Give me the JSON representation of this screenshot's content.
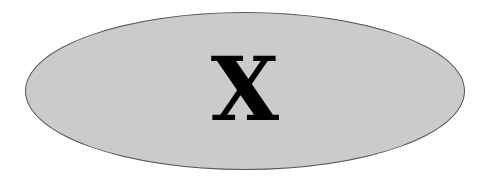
{
  "diagram": {
    "node": {
      "shape": "ellipse",
      "label": "X",
      "fill": "#cbcbcb",
      "stroke": "#555555",
      "text_color": "#000000"
    }
  }
}
